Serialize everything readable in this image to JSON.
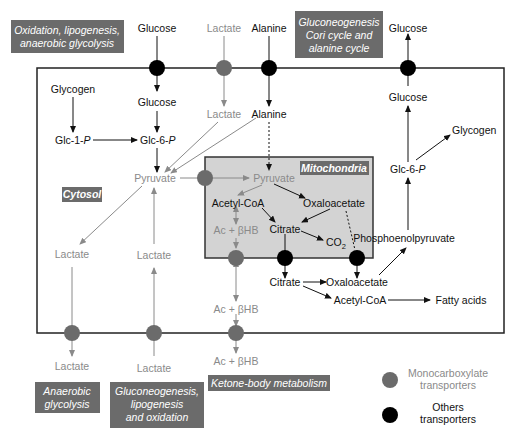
{
  "colors": {
    "label_box": "#6b6b6b",
    "mono_transporter": "#6b6b6b",
    "other_transporter": "#000000",
    "gray_text": "#8a8a8a",
    "mito_fill": "#d3d3d3"
  },
  "labels": {
    "top_left": [
      "Oxidation, lipogenesis,",
      "anaerobic glycolysis"
    ],
    "top_right": [
      "Gluconeogenesis",
      "Cori cycle and",
      "alanine cycle"
    ],
    "cytosol": "Cytosol",
    "mitochondria": "Mitochondria",
    "bottom_anaerobic": [
      "Anaerobic",
      "glycolysis"
    ],
    "bottom_gluco": [
      "Gluconeogenesis,",
      "lipogenesis",
      "and oxidation"
    ],
    "bottom_ketone": "Ketone-body metabolism"
  },
  "metabolites": {
    "glucose_ext_in": "Glucose",
    "lactate_ext_in": "Lactate",
    "alanine_ext_in": "Alanine",
    "glucose_ext_out": "Glucose",
    "glycogen_left": "Glycogen",
    "glucose_in": "Glucose",
    "lactate_in": "Lactate",
    "alanine_in": "Alanine",
    "glucose_right": "Glucose",
    "glc1p": "Glc-1-",
    "glc6p_left": "Glc-6-",
    "p_italic": "P",
    "pyruvate_cyt": "Pyruvate",
    "pyruvate_mito": "Pyruvate",
    "acetylcoa_mito": "Acetyl-CoA",
    "oxaloacetate_mito": "Oxaloacetate",
    "citrate_mito": "Citrate",
    "co2": "CO",
    "co2_sub": "2",
    "achb_mito": "Ac + βHB",
    "glycogen_right": "Glycogen",
    "glc6p_right": "Glc-6-",
    "pep": "Phosphoenolpyruvate",
    "citrate_cyt": "Citrate",
    "oxaloacetate_cyt": "Oxaloacetate",
    "acetylcoa_cyt": "Acetyl-CoA",
    "fatty_acids": "Fatty acids",
    "lactate_left_cyt": "Lactate",
    "lactate_mid_cyt": "Lactate",
    "achb_cyt": "Ac + βHB",
    "lactate_left_out": "Lactate",
    "lactate_mid_out": "Lactate",
    "achb_out": "Ac + βHB"
  },
  "legend": {
    "mono": [
      "Monocarboxylate",
      "transporters"
    ],
    "other": [
      "Others",
      "transporters"
    ]
  }
}
